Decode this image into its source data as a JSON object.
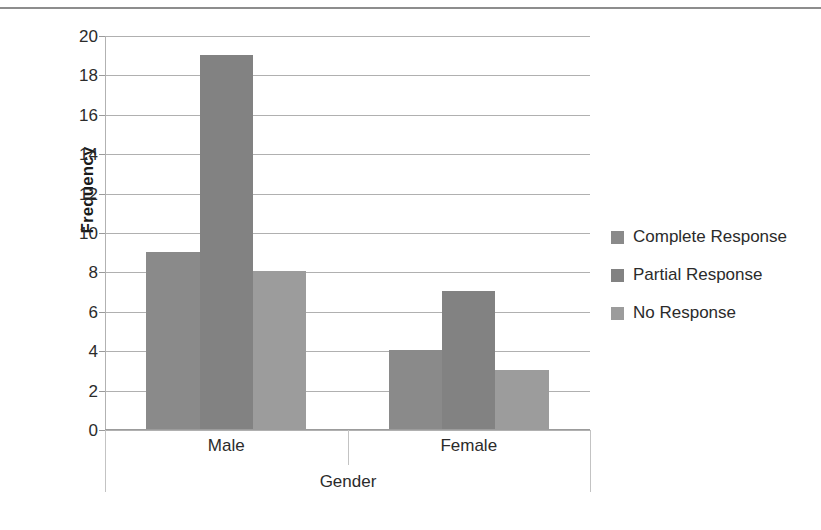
{
  "chart_data": {
    "type": "bar",
    "title": "",
    "xlabel": "Gender",
    "ylabel": "Frequency",
    "categories": [
      "Male",
      "Female"
    ],
    "series": [
      {
        "name": "Complete Response",
        "values": [
          9,
          4
        ],
        "color": "#8a8a8a"
      },
      {
        "name": "Partial Response",
        "values": [
          19,
          7
        ],
        "color": "#828282"
      },
      {
        "name": "No Response",
        "values": [
          8,
          3
        ],
        "color": "#9c9c9c"
      }
    ],
    "ylim": [
      0,
      20
    ],
    "ytick_step": 2,
    "yticks": [
      "20",
      "18",
      "16",
      "14",
      "12",
      "10",
      "8",
      "6",
      "4",
      "2",
      "0"
    ],
    "grid": true,
    "grid_axis": "y",
    "legend_position": "right",
    "bar_gap": 0,
    "background": "#ffffff",
    "axis_color": "#b0b0b0",
    "text_color": "#2b2b2b"
  },
  "legend": {
    "items": [
      {
        "label": "Complete Response"
      },
      {
        "label": "Partial Response"
      },
      {
        "label": "No Response"
      }
    ]
  }
}
